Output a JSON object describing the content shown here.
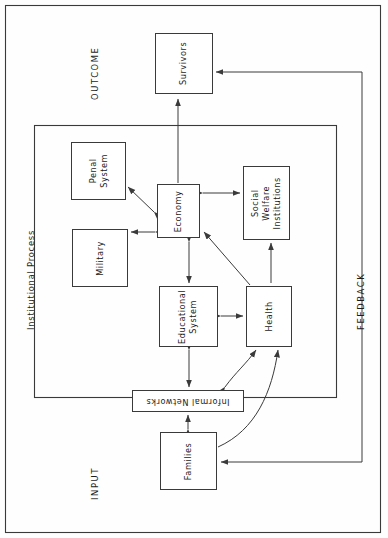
{
  "diagram": {
    "orientation": "rotated-90-ccw",
    "labels": {
      "outcome": "OUTCOME",
      "input": "INPUT",
      "feedback": "FEEDBACK",
      "institutional_process": "Institutional Process"
    },
    "nodes": [
      {
        "id": "survivors",
        "label": "Survivors",
        "x": 155,
        "y": 33,
        "w": 58,
        "h": 61,
        "rotate": -90
      },
      {
        "id": "penal_system",
        "label": "Penal\nSystem",
        "x": 71,
        "y": 142,
        "w": 55,
        "h": 58,
        "rotate": -90
      },
      {
        "id": "military",
        "label": "Military",
        "x": 72,
        "y": 229,
        "w": 56,
        "h": 58,
        "rotate": -90
      },
      {
        "id": "economy",
        "label": "Economy",
        "x": 157,
        "y": 184,
        "w": 43,
        "h": 54,
        "rotate": -90
      },
      {
        "id": "social_welfare",
        "label": "Social Welfare\nInstitutions",
        "x": 243,
        "y": 166,
        "w": 47,
        "h": 74,
        "rotate": -90
      },
      {
        "id": "educational",
        "label": "Educational\nSystem",
        "x": 159,
        "y": 286,
        "w": 59,
        "h": 61,
        "rotate": -90
      },
      {
        "id": "health",
        "label": "Health",
        "x": 246,
        "y": 286,
        "w": 46,
        "h": 61,
        "rotate": -90
      },
      {
        "id": "informal",
        "label": "Informal Networks",
        "x": 132,
        "y": 390,
        "w": 112,
        "h": 22,
        "rotate": 180
      },
      {
        "id": "families",
        "label": "Families",
        "x": 160,
        "y": 432,
        "w": 57,
        "h": 58,
        "rotate": -90
      }
    ],
    "edges": [
      {
        "from": "economy",
        "to": "survivors",
        "type": "arrow-single"
      },
      {
        "from": "economy",
        "to": "penal_system",
        "type": "arrow-double"
      },
      {
        "from": "economy",
        "to": "military",
        "type": "arrow-double"
      },
      {
        "from": "economy",
        "to": "social_welfare",
        "type": "arrow-double"
      },
      {
        "from": "economy",
        "to": "educational",
        "type": "arrow-double"
      },
      {
        "from": "health",
        "to": "economy",
        "type": "arrow-single"
      },
      {
        "from": "social_welfare",
        "to": "health",
        "type": "arrow-single"
      },
      {
        "from": "educational",
        "to": "health",
        "type": "arrow-double"
      },
      {
        "from": "educational",
        "to": "informal",
        "type": "arrow-double"
      },
      {
        "from": "informal",
        "to": "health",
        "type": "curve-double"
      },
      {
        "from": "families",
        "to": "informal",
        "type": "arrow-double"
      },
      {
        "from": "families",
        "to": "health",
        "type": "curve-single"
      },
      {
        "from": "feedback",
        "to": "survivors",
        "type": "feedback-line"
      },
      {
        "from": "feedback",
        "to": "families",
        "type": "feedback-line"
      }
    ],
    "frames": [
      {
        "id": "page-border",
        "x": 5,
        "y": 5,
        "w": 376,
        "h": 528
      },
      {
        "id": "institutional-process-frame",
        "x": 34,
        "y": 125,
        "w": 303,
        "h": 273
      }
    ],
    "colors": {
      "stroke": "#3a3a3a",
      "text": "#1c1c1c",
      "background": "#fefefe"
    }
  }
}
